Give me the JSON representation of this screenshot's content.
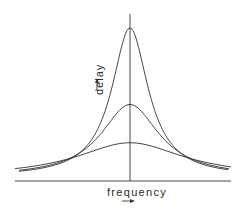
{
  "diagram": {
    "title": "",
    "x_axis": {
      "label": "frequency",
      "arrow": "right-arrow"
    },
    "y_axis": {
      "label": "delay",
      "arrow": "up-arrow"
    },
    "line_color": "#333333",
    "background": "#ffffff"
  },
  "chart_data": {
    "type": "line",
    "title": "",
    "xlabel": "frequency",
    "ylabel": "delay",
    "grid": false,
    "legend": null,
    "series": [
      {
        "name": "narrow",
        "peak_relative": 1.0,
        "relative_width": 0.2
      },
      {
        "name": "medium",
        "peak_relative": 0.5,
        "relative_width": 0.32
      },
      {
        "name": "wide",
        "peak_relative": 0.25,
        "relative_width": 0.59
      }
    ]
  }
}
